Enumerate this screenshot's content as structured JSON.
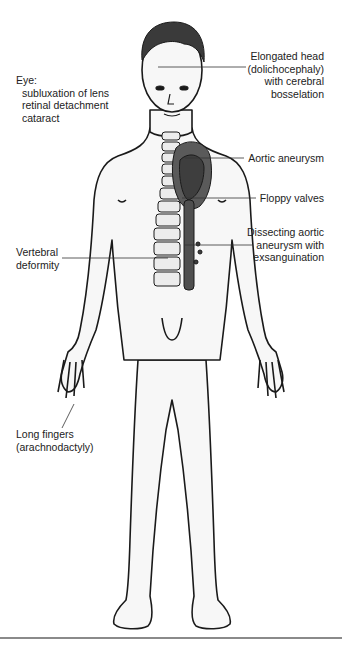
{
  "figure": {
    "colors": {
      "outline": "#1a1a1a",
      "skin": "#f7f7f7",
      "hair": "#3a3a3a",
      "heart": "#5a5a5a",
      "heart_dark": "#3e3e3e",
      "aorta": "#4f4f4f",
      "spine": "#ececec",
      "leader": "#333333",
      "rule": "#8a8a8a"
    }
  },
  "labels": {
    "eye": {
      "title": "Eye:",
      "lines": [
        "subluxation of lens",
        "retinal detachment",
        "cataract"
      ]
    },
    "head": {
      "lines": [
        "Elongated head",
        "(dolichocephaly)",
        "with cerebral",
        "bosselation"
      ]
    },
    "aortic_aneurysm": {
      "lines": [
        "Aortic aneurysm"
      ]
    },
    "floppy_valves": {
      "lines": [
        "Floppy valves"
      ]
    },
    "dissecting": {
      "lines": [
        "Dissecting aortic",
        "aneurysm with",
        "exsanguination"
      ]
    },
    "vertebral": {
      "lines": [
        "Vertebral",
        "deformity"
      ]
    },
    "fingers": {
      "lines": [
        "Long fingers",
        "(arachnodactyly)"
      ]
    }
  }
}
